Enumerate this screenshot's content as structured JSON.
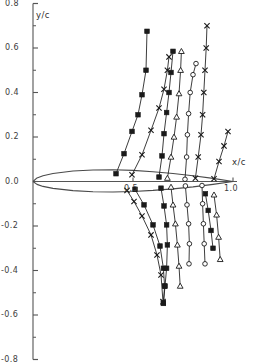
{
  "chart_data": {
    "type": "line",
    "title": "",
    "subtitle": "",
    "xlabel": "x/c",
    "ylabel": "y/c",
    "xlim": [
      0.0,
      1.06
    ],
    "ylim": [
      -0.8,
      0.8
    ],
    "grid": false,
    "legend_position": "none",
    "x_ticks_major": [
      0.5,
      1.0
    ],
    "x_ticklabels": [
      "0.5",
      "1.0"
    ],
    "x_ticks_minor": [],
    "y_ticks_major": [
      0.8,
      0.6,
      0.4,
      0.2,
      0.0,
      -0.2,
      -0.4,
      -0.6,
      -0.8
    ],
    "y_ticklabels": [
      "0.8",
      "0.6",
      "0.4",
      "0.2",
      "0.0",
      "-0.2",
      "-0.4",
      "-0.6",
      "-0.8"
    ],
    "y_ticks_minor": [
      0.7,
      0.5,
      0.3,
      0.1,
      -0.1,
      -0.3,
      -0.5,
      -0.7
    ],
    "axis_color": "#555555",
    "series_colors": [
      "#1a1a1a",
      "#1a1a1a",
      "#1a1a1a",
      "#1a1a1a"
    ],
    "airfoil": {
      "name": "airfoil-section",
      "chord": 1.0,
      "upper": [
        [
          0.0,
          0.0
        ],
        [
          0.02,
          0.016
        ],
        [
          0.05,
          0.026
        ],
        [
          0.1,
          0.036
        ],
        [
          0.2,
          0.047
        ],
        [
          0.3,
          0.052
        ],
        [
          0.4,
          0.053
        ],
        [
          0.5,
          0.05
        ],
        [
          0.6,
          0.044
        ],
        [
          0.7,
          0.036
        ],
        [
          0.8,
          0.026
        ],
        [
          0.9,
          0.014
        ],
        [
          1.0,
          0.0
        ]
      ],
      "lower": [
        [
          0.0,
          0.0
        ],
        [
          0.02,
          -0.013
        ],
        [
          0.05,
          -0.022
        ],
        [
          0.1,
          -0.031
        ],
        [
          0.2,
          -0.041
        ],
        [
          0.3,
          -0.046
        ],
        [
          0.4,
          -0.047
        ],
        [
          0.5,
          -0.045
        ],
        [
          0.6,
          -0.04
        ],
        [
          0.7,
          -0.033
        ],
        [
          0.8,
          -0.024
        ],
        [
          0.9,
          -0.013
        ],
        [
          1.0,
          0.0
        ]
      ]
    },
    "series": [
      {
        "name": "upper-series-square",
        "marker": "filled-square",
        "points": [
          [
            0.415,
            0.035
          ],
          [
            0.455,
            0.125
          ],
          [
            0.495,
            0.225
          ],
          [
            0.525,
            0.3
          ],
          [
            0.545,
            0.39
          ],
          [
            0.565,
            0.5
          ],
          [
            0.57,
            0.675
          ]
        ]
      },
      {
        "name": "upper-series-cross-left",
        "marker": "cross-x",
        "points": [
          [
            0.495,
            0.03
          ],
          [
            0.545,
            0.12
          ],
          [
            0.59,
            0.23
          ],
          [
            0.63,
            0.33
          ],
          [
            0.655,
            0.415
          ],
          [
            0.672,
            0.5
          ],
          [
            0.68,
            0.56
          ]
        ]
      },
      {
        "name": "upper-series-square-mid",
        "marker": "filled-square",
        "points": [
          [
            0.63,
            0.02
          ],
          [
            0.645,
            0.115
          ],
          [
            0.655,
            0.215
          ],
          [
            0.668,
            0.31
          ],
          [
            0.68,
            0.4
          ],
          [
            0.69,
            0.49
          ],
          [
            0.7,
            0.585
          ]
        ]
      },
      {
        "name": "upper-series-triangle",
        "marker": "open-triangle",
        "points": [
          [
            0.672,
            0.015
          ],
          [
            0.69,
            0.11
          ],
          [
            0.705,
            0.2
          ],
          [
            0.718,
            0.29
          ],
          [
            0.73,
            0.395
          ],
          [
            0.738,
            0.5
          ],
          [
            0.742,
            0.585
          ]
        ]
      },
      {
        "name": "upper-series-circle",
        "marker": "open-circle",
        "points": [
          [
            0.76,
            0.01
          ],
          [
            0.768,
            0.11
          ],
          [
            0.772,
            0.21
          ],
          [
            0.778,
            0.305
          ],
          [
            0.786,
            0.4
          ],
          [
            0.8,
            0.48
          ],
          [
            0.815,
            0.53
          ]
        ]
      },
      {
        "name": "upper-series-cross-right",
        "marker": "cross-x",
        "points": [
          [
            0.812,
            0.015
          ],
          [
            0.826,
            0.11
          ],
          [
            0.84,
            0.21
          ],
          [
            0.848,
            0.3
          ],
          [
            0.854,
            0.4
          ],
          [
            0.86,
            0.5
          ],
          [
            0.866,
            0.6
          ],
          [
            0.87,
            0.7
          ]
        ]
      },
      {
        "name": "upper-series-cross-far",
        "marker": "cross-x",
        "points": [
          [
            0.905,
            0.012
          ],
          [
            0.93,
            0.09
          ],
          [
            0.955,
            0.16
          ],
          [
            0.975,
            0.225
          ]
        ]
      },
      {
        "name": "lower-series-cross-left",
        "marker": "cross-x",
        "points": [
          [
            0.47,
            -0.04
          ],
          [
            0.505,
            -0.09
          ],
          [
            0.545,
            -0.155
          ],
          [
            0.59,
            -0.24
          ],
          [
            0.62,
            -0.33
          ],
          [
            0.64,
            -0.42
          ],
          [
            0.65,
            -0.54
          ]
        ]
      },
      {
        "name": "lower-series-square",
        "marker": "filled-square",
        "points": [
          [
            0.51,
            -0.035
          ],
          [
            0.555,
            -0.105
          ],
          [
            0.6,
            -0.195
          ],
          [
            0.635,
            -0.29
          ],
          [
            0.652,
            -0.39
          ],
          [
            0.658,
            -0.47
          ],
          [
            0.652,
            -0.545
          ]
        ]
      },
      {
        "name": "lower-series-square-mid",
        "marker": "filled-square",
        "points": [
          [
            0.64,
            -0.03
          ],
          [
            0.655,
            -0.11
          ],
          [
            0.668,
            -0.195
          ],
          [
            0.672,
            -0.285
          ],
          [
            0.668,
            -0.39
          ],
          [
            0.66,
            -0.47
          ],
          [
            0.652,
            -0.548
          ]
        ]
      },
      {
        "name": "lower-series-triangle",
        "marker": "open-triangle",
        "points": [
          [
            0.69,
            -0.025
          ],
          [
            0.7,
            -0.105
          ],
          [
            0.712,
            -0.19
          ],
          [
            0.722,
            -0.285
          ],
          [
            0.73,
            -0.38
          ],
          [
            0.736,
            -0.47
          ]
        ]
      },
      {
        "name": "lower-series-circle",
        "marker": "open-circle",
        "points": [
          [
            0.762,
            -0.02
          ],
          [
            0.77,
            -0.105
          ],
          [
            0.778,
            -0.19
          ],
          [
            0.782,
            -0.28
          ],
          [
            0.78,
            -0.37
          ]
        ]
      },
      {
        "name": "lower-series-circle-right",
        "marker": "open-circle",
        "points": [
          [
            0.845,
            -0.018
          ],
          [
            0.848,
            -0.1
          ],
          [
            0.852,
            -0.19
          ],
          [
            0.856,
            -0.28
          ],
          [
            0.86,
            -0.37
          ]
        ]
      },
      {
        "name": "lower-series-square-right",
        "marker": "filled-square",
        "points": [
          [
            0.862,
            -0.055
          ],
          [
            0.876,
            -0.13
          ],
          [
            0.89,
            -0.22
          ],
          [
            0.9,
            -0.3
          ]
        ]
      },
      {
        "name": "lower-series-triangle-right",
        "marker": "open-triangle",
        "points": [
          [
            0.905,
            -0.06
          ],
          [
            0.918,
            -0.15
          ],
          [
            0.928,
            -0.25
          ],
          [
            0.936,
            -0.35
          ]
        ]
      }
    ]
  },
  "axes": {
    "y_axis_title": "y/c",
    "x_axis_title": "x/c"
  }
}
